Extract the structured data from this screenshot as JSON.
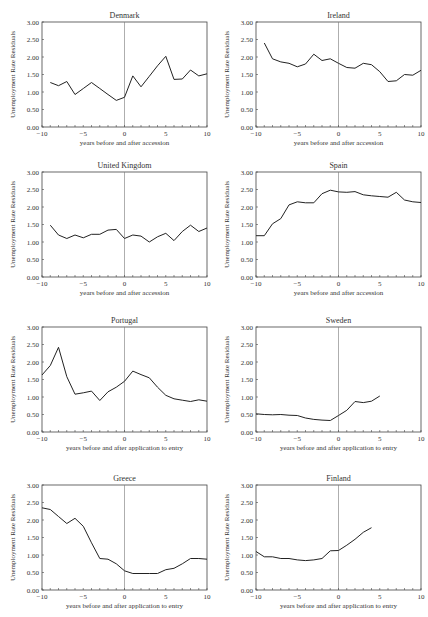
{
  "page": {
    "header_fragment": ""
  },
  "axis_defaults": {
    "ylabel": "Unemployment Rate Residuals",
    "yticks": [
      "0.00",
      "0.50",
      "1.00",
      "1.50",
      "2.00",
      "2.50",
      "3.00"
    ],
    "xticks": [
      "−10",
      "−5",
      "0",
      "5",
      "10"
    ],
    "ylim": [
      0,
      3
    ],
    "xlim": [
      -10,
      10
    ]
  },
  "chart_data": [
    {
      "type": "line",
      "title": "Denmark",
      "xlabel": "years before and after accession",
      "ylabel": "Unemployment Rate Residuals",
      "xlim": [
        -10,
        10
      ],
      "ylim": [
        0,
        3
      ],
      "x": [
        -9,
        -8,
        -7,
        -6,
        -5,
        -4,
        -3,
        -2,
        -1,
        0,
        1,
        2,
        3,
        4,
        5,
        6,
        7,
        8,
        9,
        10
      ],
      "values": [
        1.27,
        1.18,
        1.3,
        0.93,
        1.1,
        1.27,
        1.1,
        0.93,
        0.76,
        0.85,
        1.46,
        1.15,
        1.45,
        1.75,
        2.02,
        1.36,
        1.37,
        1.63,
        1.46,
        1.52
      ]
    },
    {
      "type": "line",
      "title": "Ireland",
      "xlabel": "years before and after accession",
      "ylabel": "Unemployment Rate Residuals",
      "xlim": [
        -10,
        10
      ],
      "ylim": [
        0,
        3
      ],
      "x": [
        -9,
        -8,
        -7,
        -6,
        -5,
        -4,
        -3,
        -2,
        -1,
        0,
        1,
        2,
        3,
        4,
        5,
        6,
        7,
        8,
        9,
        10
      ],
      "values": [
        2.4,
        1.95,
        1.86,
        1.82,
        1.72,
        1.8,
        2.08,
        1.9,
        1.95,
        1.82,
        1.7,
        1.68,
        1.82,
        1.78,
        1.58,
        1.3,
        1.32,
        1.5,
        1.48,
        1.62
      ]
    },
    {
      "type": "line",
      "title": "United Kingdom",
      "xlabel": "years before and after accession",
      "ylabel": "Unemployment Rate Residuals",
      "xlim": [
        -10,
        10
      ],
      "ylim": [
        0,
        3
      ],
      "x": [
        -9,
        -8,
        -7,
        -6,
        -5,
        -4,
        -3,
        -2,
        -1,
        0,
        1,
        2,
        3,
        4,
        5,
        6,
        7,
        8,
        9,
        10
      ],
      "values": [
        1.48,
        1.2,
        1.1,
        1.2,
        1.12,
        1.22,
        1.22,
        1.34,
        1.36,
        1.1,
        1.2,
        1.17,
        1.0,
        1.15,
        1.25,
        1.04,
        1.3,
        1.48,
        1.3,
        1.4
      ]
    },
    {
      "type": "line",
      "title": "Spain",
      "xlabel": "years before and after accession",
      "ylabel": "Unemployment Rate Residuals",
      "xlim": [
        -10,
        10
      ],
      "ylim": [
        0,
        3
      ],
      "x": [
        -10,
        -9,
        -8,
        -7,
        -6,
        -5,
        -4,
        -3,
        -2,
        -1,
        0,
        1,
        2,
        3,
        4,
        5,
        6,
        7,
        8,
        9,
        10
      ],
      "values": [
        1.18,
        1.18,
        1.52,
        1.67,
        2.06,
        2.15,
        2.12,
        2.12,
        2.38,
        2.48,
        2.43,
        2.42,
        2.44,
        2.35,
        2.32,
        2.3,
        2.28,
        2.42,
        2.2,
        2.15,
        2.13
      ]
    },
    {
      "type": "line",
      "title": "Portugal",
      "xlabel": "years before and after application to entry",
      "ylabel": "Unemployment Rate Residuals",
      "xlim": [
        -10,
        10
      ],
      "ylim": [
        0,
        3
      ],
      "x": [
        -10,
        -9,
        -8,
        -7,
        -6,
        -5,
        -4,
        -3,
        -2,
        -1,
        0,
        1,
        2,
        3,
        4,
        5,
        6,
        7,
        8,
        9,
        10
      ],
      "values": [
        1.63,
        1.9,
        2.42,
        1.58,
        1.08,
        1.12,
        1.17,
        0.9,
        1.15,
        1.28,
        1.45,
        1.74,
        1.64,
        1.55,
        1.28,
        1.05,
        0.95,
        0.91,
        0.87,
        0.92,
        0.88
      ]
    },
    {
      "type": "line",
      "title": "Sweden",
      "xlabel": "years before and after application to entry",
      "ylabel": "Unemployment Rate Residuals",
      "xlim": [
        -10,
        10
      ],
      "ylim": [
        0,
        3
      ],
      "x": [
        -10,
        -9,
        -8,
        -7,
        -6,
        -5,
        -4,
        -3,
        -2,
        -1,
        0,
        1,
        2,
        3,
        4,
        5
      ],
      "values": [
        0.52,
        0.5,
        0.49,
        0.5,
        0.48,
        0.47,
        0.4,
        0.36,
        0.34,
        0.33,
        0.47,
        0.62,
        0.87,
        0.84,
        0.88,
        1.03
      ]
    },
    {
      "type": "line",
      "title": "Greece",
      "xlabel": "years before and after application to entry",
      "ylabel": "Unemployment Rate Residuals",
      "xlim": [
        -10,
        10
      ],
      "ylim": [
        0,
        3
      ],
      "x": [
        -10,
        -9,
        -8,
        -7,
        -6,
        -5,
        -4,
        -3,
        -2,
        -1,
        0,
        1,
        2,
        3,
        4,
        5,
        6,
        7,
        8,
        9,
        10
      ],
      "values": [
        2.35,
        2.3,
        2.1,
        1.9,
        2.05,
        1.82,
        1.35,
        0.9,
        0.88,
        0.75,
        0.55,
        0.47,
        0.47,
        0.47,
        0.47,
        0.58,
        0.62,
        0.75,
        0.9,
        0.9,
        0.88
      ]
    },
    {
      "type": "line",
      "title": "Finland",
      "xlabel": "years before and after application to entry",
      "ylabel": "Unemployment Rate Residuals",
      "xlim": [
        -10,
        10
      ],
      "ylim": [
        0,
        3
      ],
      "x": [
        -10,
        -9,
        -8,
        -7,
        -6,
        -5,
        -4,
        -3,
        -2,
        -1,
        0,
        1,
        2,
        3,
        4
      ],
      "values": [
        1.1,
        0.95,
        0.95,
        0.9,
        0.9,
        0.86,
        0.84,
        0.86,
        0.9,
        1.12,
        1.13,
        1.28,
        1.45,
        1.65,
        1.78
      ]
    }
  ],
  "panels": [
    {
      "left": 0,
      "top": 0,
      "title": "Denmark"
    },
    {
      "left": 214,
      "top": 0,
      "title": "Ireland"
    },
    {
      "left": 0,
      "top": 150,
      "title": "United Kingdom"
    },
    {
      "left": 214,
      "top": 150,
      "title": "Spain"
    },
    {
      "left": 0,
      "top": 305,
      "title": "Portugal"
    },
    {
      "left": 214,
      "top": 305,
      "title": "Sweden"
    },
    {
      "left": 0,
      "top": 463,
      "title": "Greece"
    },
    {
      "left": 214,
      "top": 463,
      "title": "Finland"
    }
  ]
}
